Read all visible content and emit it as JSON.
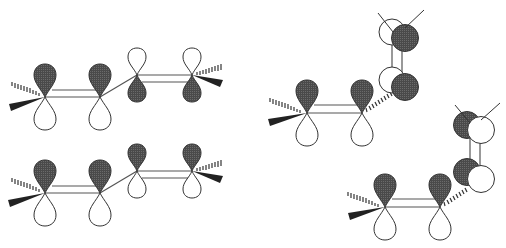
{
  "diagram": {
    "type": "molecular-orbital-diagram",
    "colors": {
      "filled_lobe": "#4a4a4a",
      "open_lobe": "#ffffff",
      "stroke": "#333333",
      "bond": "#555555"
    },
    "panels": [
      {
        "id": "top-left",
        "conformation": "planar s-trans",
        "atoms": [
          {
            "x": 45,
            "y": 97,
            "upper": "filled",
            "lower": "open"
          },
          {
            "x": 100,
            "y": 97,
            "upper": "filled",
            "lower": "open"
          },
          {
            "x": 137,
            "y": 75,
            "upper": "open",
            "lower": "filled"
          },
          {
            "x": 192,
            "y": 75,
            "upper": "open",
            "lower": "filled"
          }
        ]
      },
      {
        "id": "bottom-left",
        "conformation": "planar s-trans",
        "atoms": [
          {
            "x": 45,
            "y": 193,
            "upper": "filled",
            "lower": "open"
          },
          {
            "x": 100,
            "y": 193,
            "upper": "filled",
            "lower": "open"
          },
          {
            "x": 137,
            "y": 171,
            "upper": "filled",
            "lower": "open"
          },
          {
            "x": 192,
            "y": 171,
            "upper": "filled",
            "lower": "open"
          }
        ]
      },
      {
        "id": "top-right",
        "conformation": "perpendicular",
        "atoms": [
          {
            "x": 307,
            "y": 113,
            "upper": "filled",
            "lower": "open"
          },
          {
            "x": 362,
            "y": 113,
            "upper": "filled",
            "lower": "open"
          },
          {
            "x": 405,
            "y": 87,
            "front": "filled",
            "back": "open"
          },
          {
            "x": 405,
            "y": 38,
            "front": "filled",
            "back": "open"
          }
        ]
      },
      {
        "id": "bottom-right",
        "conformation": "perpendicular",
        "atoms": [
          {
            "x": 385,
            "y": 207,
            "upper": "filled",
            "lower": "open"
          },
          {
            "x": 440,
            "y": 207,
            "upper": "filled",
            "lower": "open"
          },
          {
            "x": 478,
            "y": 178,
            "front": "open",
            "back": "filled"
          },
          {
            "x": 478,
            "y": 130,
            "front": "open",
            "back": "filled"
          }
        ]
      }
    ]
  }
}
